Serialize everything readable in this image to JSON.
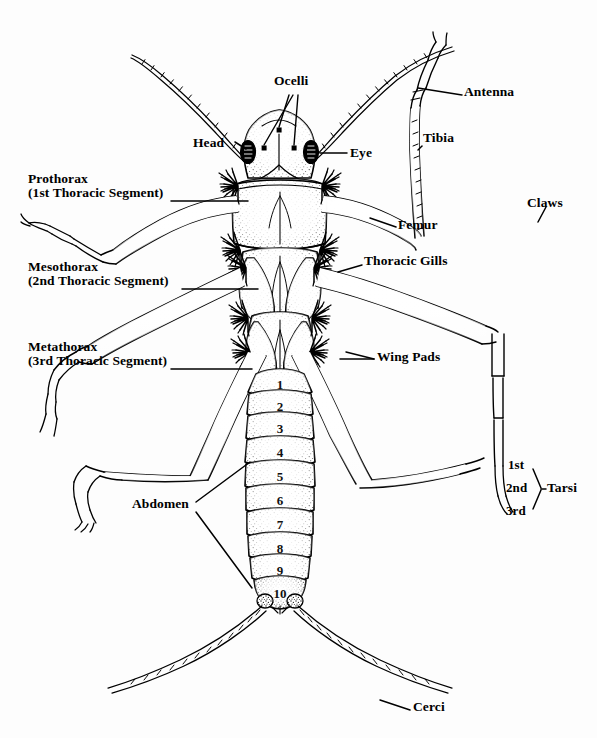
{
  "figure": {
    "background_color": "#fdfdfd",
    "ink_color": "#000000"
  },
  "labels": {
    "ocelli": "Ocelli",
    "head": "Head",
    "eye": "Eye",
    "antenna": "Antenna",
    "tibia": "Tibia",
    "femur": "Femur",
    "claws": "Claws",
    "thoracic_gills": "Thoracic Gills",
    "wing_pads": "Wing Pads",
    "abdomen": "Abdomen",
    "cerci": "Cerci",
    "tarsi": "Tarsi",
    "prothorax_line1": "Prothorax",
    "prothorax_line2": "(1st Thoracic Segment)",
    "mesothorax_line1": "Mesothorax",
    "mesothorax_line2": "(2nd Thoracic Segment)",
    "metathorax_line1": "Metathorax",
    "metathorax_line2": "(3rd Thoracic Segment)",
    "tarsus_1": "1st",
    "tarsus_2": "2nd",
    "tarsus_3": "3rd"
  },
  "abdomen_segments": {
    "count": 10,
    "numbers": [
      "1",
      "2",
      "3",
      "4",
      "5",
      "6",
      "7",
      "8",
      "9",
      "10"
    ]
  }
}
